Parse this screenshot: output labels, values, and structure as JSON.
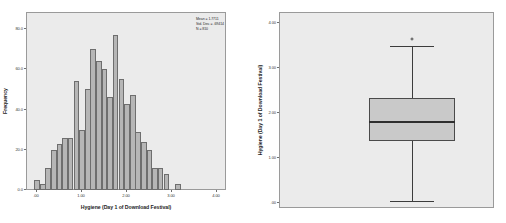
{
  "figure": {
    "background": "#ffffff",
    "panel_background": "#ebebeb",
    "bar_fill": "#b6b6b6",
    "bar_edge": "#6e6e6e",
    "box_fill": "#c9c9c9",
    "line_color": "#3c3c3c"
  },
  "chart_data": [
    {
      "type": "bar",
      "id": "histogram",
      "title": "",
      "xlabel": "Hygiene (Day 1 of Download Festival)",
      "ylabel": "Frequency",
      "xlim": [
        -0.2,
        4.2
      ],
      "ylim": [
        0,
        88
      ],
      "grid": false,
      "legend": "none",
      "xtick_labels": [
        ".00",
        "1.00",
        "2.00",
        "3.00",
        "4.00"
      ],
      "xtick_values": [
        0,
        1,
        2,
        3,
        4
      ],
      "ytick_labels": [
        "0.0",
        "20.0",
        "40.0",
        "60.0",
        "80.0"
      ],
      "ytick_values": [
        0,
        20,
        40,
        60,
        80
      ],
      "bin_width": 0.125,
      "x": [
        0.02,
        0.15,
        0.27,
        0.4,
        0.52,
        0.65,
        0.77,
        0.9,
        1.02,
        1.15,
        1.27,
        1.4,
        1.52,
        1.65,
        1.77,
        1.9,
        2.02,
        2.15,
        2.27,
        2.4,
        2.52,
        2.65,
        2.77,
        2.9,
        3.02,
        3.15,
        3.27,
        3.4,
        3.52,
        3.65
      ],
      "values": [
        5,
        3,
        11,
        20,
        23,
        26,
        26,
        54,
        30,
        50,
        70,
        64,
        60,
        46,
        77,
        55,
        43,
        47,
        29,
        24,
        20,
        11,
        11,
        8,
        0,
        3,
        0,
        0,
        0,
        0
      ],
      "annotation": {
        "mean_label": "Mean = 1.7711",
        "std_label": "Std. Dev. = .69414",
        "n_label": "N = 810"
      }
    },
    {
      "type": "boxplot",
      "id": "boxplot",
      "title": "",
      "xlabel": "",
      "ylabel": "Hygiene (Day 1 of Download Festival)",
      "ylim": [
        -0.12,
        4.2
      ],
      "grid": false,
      "legend": "none",
      "ytick_labels": [
        "4.00",
        "3.00",
        "2.00",
        "1.00",
        ".00"
      ],
      "ytick_values": [
        4,
        3,
        2,
        1,
        0
      ],
      "boxes": [
        {
          "name": "Hygiene Day 1",
          "whisker_low": 0.02,
          "q1": 1.35,
          "median": 1.79,
          "q3": 2.31,
          "whisker_high": 3.47,
          "outliers": [
            3.61
          ]
        }
      ]
    }
  ],
  "histogram": {
    "x_title": "Hygiene (Day 1 of Download Festival)",
    "y_title": "Frequency",
    "stats": {
      "mean": "Mean = 1.7711",
      "std_dev": "Std. Dev. = .69414",
      "n": "N = 810"
    }
  },
  "boxplot": {
    "y_title": "Hygiene (Day 1 of Download Festival)"
  }
}
